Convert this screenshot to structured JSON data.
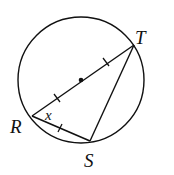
{
  "diagram": {
    "type": "circle-geometry",
    "labels": {
      "R": "R",
      "S": "S",
      "T": "T",
      "angle": "x"
    },
    "points": {
      "center": [
        81,
        80
      ],
      "R": [
        32,
        116
      ],
      "S": [
        90,
        141
      ],
      "T": [
        134,
        45
      ]
    },
    "circle": {
      "cx": 81,
      "cy": 80,
      "r": 63
    },
    "segments": [
      "RT (diameter)",
      "RS",
      "ST"
    ],
    "tick_marks": "RO, OT and RS each marked with one tick (congruent)",
    "colors": {
      "stroke": "#111111",
      "background": "#ffffff"
    }
  }
}
